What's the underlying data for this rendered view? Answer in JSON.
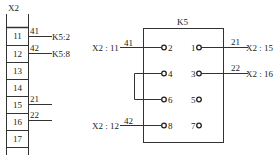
{
  "terminal_block": {
    "name": "X2",
    "terminals": [
      "11",
      "12",
      "13",
      "14",
      "15",
      "16",
      "17"
    ],
    "wires": [
      {
        "terminal": "11",
        "wire": "41",
        "dest": "K5:2"
      },
      {
        "terminal": "12",
        "wire": "42",
        "dest": "K5:8"
      },
      {
        "terminal": "15",
        "wire": "21",
        "dest": ""
      },
      {
        "terminal": "16",
        "wire": "22",
        "dest": ""
      }
    ]
  },
  "relay": {
    "name": "K5",
    "left_pins": [
      "2",
      "4",
      "6",
      "8"
    ],
    "right_pins": [
      "1",
      "3",
      "5",
      "7"
    ],
    "left_connections": [
      {
        "pin": "2",
        "wire": "41",
        "source": "X2 : 11"
      },
      {
        "pin": "8",
        "wire": "42",
        "source": "X2 : 12"
      }
    ],
    "right_connections": [
      {
        "pin": "1",
        "wire": "21",
        "dest": "X2 : 15"
      },
      {
        "pin": "3",
        "wire": "22",
        "dest": "X2 : 16"
      }
    ],
    "jumper": "4-6"
  }
}
